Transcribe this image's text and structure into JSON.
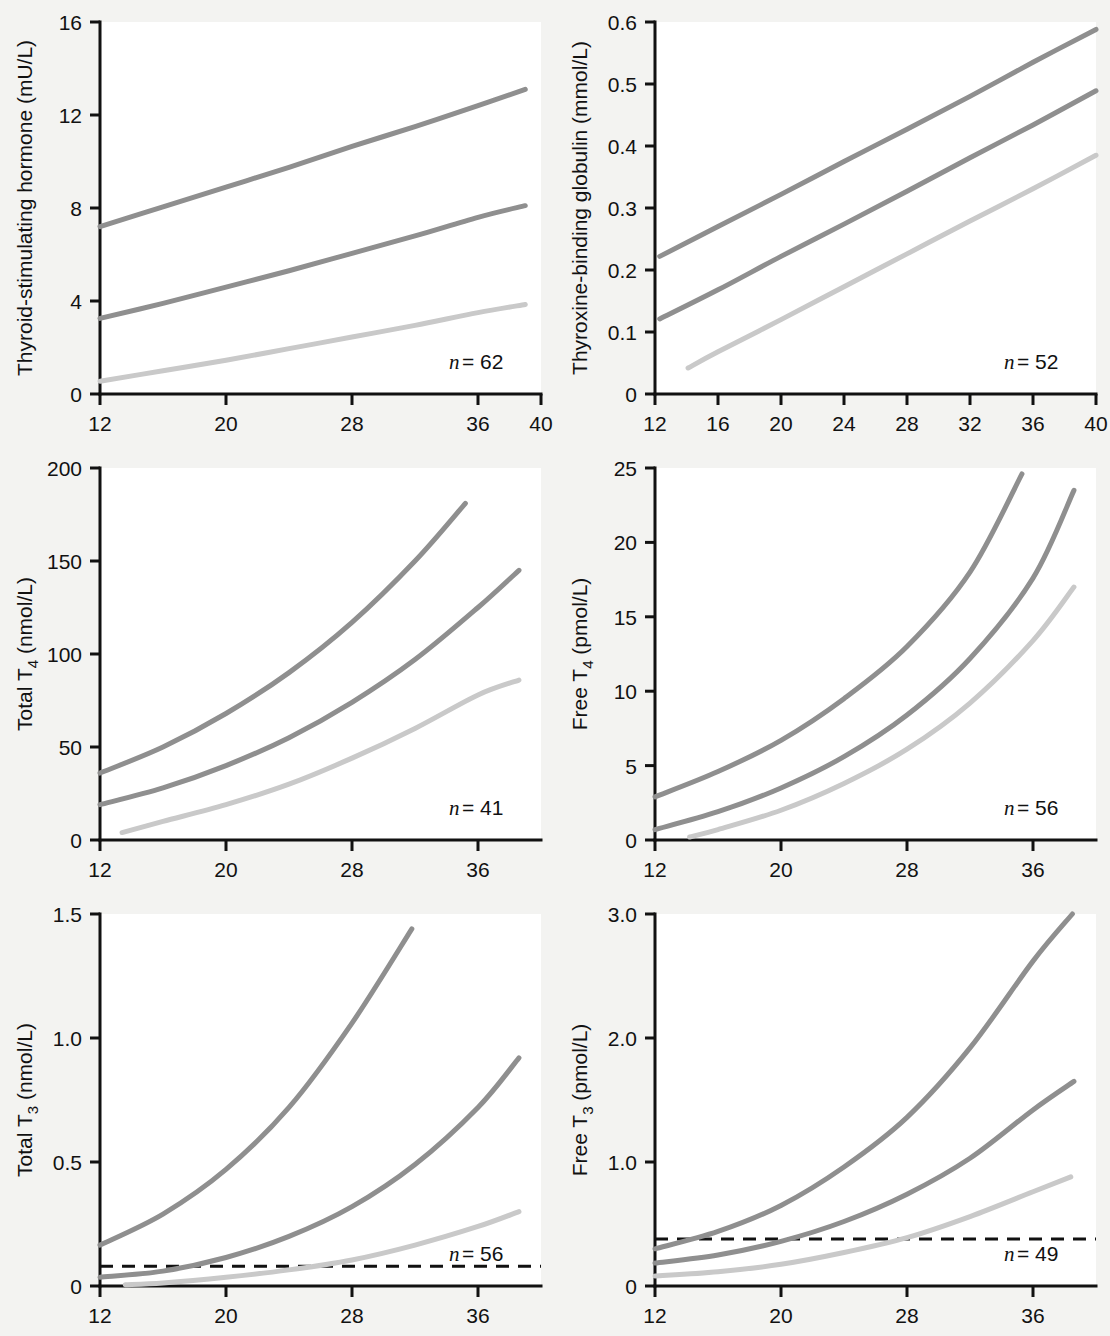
{
  "figure": {
    "background_color": "#f3f3f1",
    "axis_color": "#111111",
    "shared_xlabel": "Gestation (wk)",
    "curve_colors": {
      "upper": "#8f8f8f",
      "median": "#8f8f8f",
      "lower": "#c9c9c9"
    }
  },
  "chart_data": [
    {
      "id": "A",
      "type": "line",
      "panel_letter": "A",
      "title": "",
      "ylabel": "Thyroid-stimulating hormone (mU/L)",
      "ylabel_main": "Thyroid-stimulating hormone (mU/L)",
      "xlabel": "Gestation (wk)",
      "annotation_italic": "n",
      "annotation_text": " = 62",
      "annotation_full": "n = 62",
      "sample_size": 62,
      "xlim": [
        12,
        40
      ],
      "ylim": [
        0,
        16
      ],
      "xticks": [
        12,
        20,
        28,
        36,
        40
      ],
      "xtick_labels": [
        "12",
        "20",
        "28",
        "36",
        "40"
      ],
      "yticks": [
        0,
        4,
        8,
        12,
        16
      ],
      "ytick_labels": [
        "0",
        "4",
        "8",
        "12",
        "16"
      ],
      "grid": false,
      "legend": "none",
      "reference_line": null,
      "series": [
        {
          "name": "upper-centile",
          "color": "#8f8f8f",
          "x": [
            12,
            16,
            20,
            24,
            28,
            32,
            36,
            39
          ],
          "values": [
            7.2,
            8.05,
            8.9,
            9.75,
            10.65,
            11.5,
            12.4,
            13.1
          ]
        },
        {
          "name": "median",
          "color": "#8f8f8f",
          "x": [
            12,
            16,
            20,
            24,
            28,
            32,
            36,
            39
          ],
          "values": [
            3.25,
            3.9,
            4.6,
            5.3,
            6.05,
            6.8,
            7.6,
            8.1
          ]
        },
        {
          "name": "lower-centile",
          "color": "#c9c9c9",
          "x": [
            12,
            16,
            20,
            24,
            28,
            32,
            36,
            39
          ],
          "values": [
            0.55,
            1.0,
            1.45,
            1.95,
            2.45,
            2.95,
            3.5,
            3.85
          ]
        }
      ]
    },
    {
      "id": "B",
      "type": "line",
      "panel_letter": "B",
      "title": "",
      "ylabel": "Thyroxine-binding globulin (mmol/L)",
      "ylabel_main": "Thyroxine-binding globulin (mmol/L)",
      "xlabel": "Gestation (wk)",
      "annotation_italic": "n",
      "annotation_text": " = 52",
      "annotation_full": "n = 52",
      "sample_size": 52,
      "xlim": [
        12,
        40
      ],
      "ylim": [
        0,
        0.6
      ],
      "xticks": [
        12,
        16,
        20,
        24,
        28,
        32,
        36,
        40
      ],
      "xtick_labels": [
        "12",
        "16",
        "20",
        "24",
        "28",
        "32",
        "36",
        "40"
      ],
      "yticks": [
        0,
        0.1,
        0.2,
        0.3,
        0.4,
        0.5,
        0.6
      ],
      "ytick_labels": [
        "0",
        "0.1",
        "0.2",
        "0.3",
        "0.4",
        "0.5",
        "0.6"
      ],
      "grid": false,
      "legend": "none",
      "reference_line": null,
      "series": [
        {
          "name": "upper-centile",
          "color": "#8f8f8f",
          "x": [
            12.3,
            16,
            20,
            24,
            28,
            32,
            36,
            40
          ],
          "values": [
            0.222,
            0.27,
            0.322,
            0.375,
            0.427,
            0.48,
            0.535,
            0.588
          ]
        },
        {
          "name": "median",
          "color": "#8f8f8f",
          "x": [
            12.3,
            16,
            20,
            24,
            28,
            32,
            36,
            40
          ],
          "values": [
            0.121,
            0.168,
            0.222,
            0.274,
            0.327,
            0.381,
            0.434,
            0.489
          ]
        },
        {
          "name": "lower-centile",
          "color": "#c9c9c9",
          "x": [
            14.1,
            16,
            20,
            24,
            28,
            32,
            36,
            40
          ],
          "values": [
            0.042,
            0.068,
            0.12,
            0.173,
            0.226,
            0.279,
            0.331,
            0.385
          ]
        }
      ]
    },
    {
      "id": "C",
      "type": "line",
      "panel_letter": "C",
      "title": "",
      "ylabel": "Total T4 (nmol/L)",
      "ylabel_main": "Total T",
      "ylabel_sub": "4",
      "ylabel_tail": " (nmol/L)",
      "xlabel": "Gestation (wk)",
      "annotation_italic": "n",
      "annotation_text": " = 41",
      "annotation_full": "n = 41",
      "sample_size": 41,
      "xlim": [
        12,
        40
      ],
      "ylim": [
        0,
        200
      ],
      "xticks": [
        12,
        20,
        28,
        36
      ],
      "xtick_labels": [
        "12",
        "20",
        "28",
        "36"
      ],
      "yticks": [
        0,
        50,
        100,
        150,
        200
      ],
      "ytick_labels": [
        "0",
        "50",
        "100",
        "150",
        "200"
      ],
      "grid": false,
      "legend": "none",
      "reference_line": null,
      "series": [
        {
          "name": "upper-centile",
          "color": "#8f8f8f",
          "x": [
            12,
            16,
            20,
            24,
            28,
            32,
            35.2
          ],
          "values": [
            36,
            50,
            68,
            90,
            117,
            150,
            181
          ]
        },
        {
          "name": "median",
          "color": "#8f8f8f",
          "x": [
            12,
            16,
            20,
            24,
            28,
            32,
            36,
            38.6
          ],
          "values": [
            19,
            28,
            40,
            55,
            74,
            97,
            125,
            145
          ]
        },
        {
          "name": "lower-centile",
          "color": "#c9c9c9",
          "x": [
            13.4,
            16,
            20,
            24,
            28,
            32,
            36,
            38.6
          ],
          "values": [
            4,
            10,
            19,
            30,
            44,
            60,
            78,
            86
          ]
        }
      ]
    },
    {
      "id": "D",
      "type": "line",
      "panel_letter": "D",
      "title": "",
      "ylabel": "Free T4 (pmol/L)",
      "ylabel_main": "Free T",
      "ylabel_sub": "4",
      "ylabel_tail": " (pmol/L)",
      "xlabel": "Gestation (wk)",
      "annotation_italic": "n",
      "annotation_text": " = 56",
      "annotation_full": "n = 56",
      "sample_size": 56,
      "xlim": [
        12,
        40
      ],
      "ylim": [
        0,
        25
      ],
      "xticks": [
        12,
        20,
        28,
        36
      ],
      "xtick_labels": [
        "12",
        "20",
        "28",
        "36"
      ],
      "yticks": [
        0,
        5,
        10,
        15,
        20,
        25
      ],
      "ytick_labels": [
        "0",
        "5",
        "10",
        "15",
        "20",
        "25"
      ],
      "grid": false,
      "legend": "none",
      "reference_line": null,
      "series": [
        {
          "name": "upper-centile",
          "color": "#8f8f8f",
          "x": [
            12,
            16,
            20,
            24,
            28,
            32,
            35.3
          ],
          "values": [
            2.9,
            4.6,
            6.7,
            9.5,
            13.0,
            18.0,
            24.6
          ]
        },
        {
          "name": "median",
          "color": "#8f8f8f",
          "x": [
            12,
            16,
            20,
            24,
            28,
            32,
            36,
            38.6
          ],
          "values": [
            0.7,
            1.9,
            3.5,
            5.6,
            8.4,
            12.2,
            17.6,
            23.5
          ]
        },
        {
          "name": "lower-centile",
          "color": "#c9c9c9",
          "x": [
            14.2,
            16,
            20,
            24,
            28,
            32,
            36,
            38.6
          ],
          "values": [
            0.2,
            0.7,
            2.0,
            3.8,
            6.1,
            9.2,
            13.4,
            17.0
          ]
        }
      ]
    },
    {
      "id": "E",
      "type": "line",
      "panel_letter": "E",
      "title": "",
      "ylabel": "Total T3 (nmol/L)",
      "ylabel_main": "Total T",
      "ylabel_sub": "3",
      "ylabel_tail": " (nmol/L)",
      "xlabel": "Gestation (wk)",
      "annotation_italic": "n",
      "annotation_text": " = 56",
      "annotation_full": "n = 56",
      "sample_size": 56,
      "xlim": [
        12,
        40
      ],
      "ylim": [
        0,
        1.5
      ],
      "xticks": [
        12,
        20,
        28,
        36
      ],
      "xtick_labels": [
        "12",
        "20",
        "28",
        "36"
      ],
      "yticks": [
        0,
        0.5,
        1.0,
        1.5
      ],
      "ytick_labels": [
        "0",
        "0.5",
        "1.0",
        "1.5"
      ],
      "grid": false,
      "legend": "none",
      "reference_line": {
        "y": 0.08,
        "style": "dashed",
        "color": "#111111"
      },
      "series": [
        {
          "name": "upper-centile",
          "color": "#8f8f8f",
          "x": [
            12,
            16,
            20,
            24,
            28,
            31.8
          ],
          "values": [
            0.165,
            0.29,
            0.47,
            0.72,
            1.06,
            1.44
          ]
        },
        {
          "name": "median",
          "color": "#8f8f8f",
          "x": [
            12,
            16,
            20,
            24,
            28,
            32,
            36,
            38.6
          ],
          "values": [
            0.035,
            0.06,
            0.115,
            0.2,
            0.32,
            0.49,
            0.72,
            0.92
          ]
        },
        {
          "name": "lower-centile",
          "color": "#c9c9c9",
          "x": [
            13.6,
            16,
            20,
            24,
            28,
            32,
            36,
            38.6
          ],
          "values": [
            0.005,
            0.012,
            0.035,
            0.065,
            0.105,
            0.165,
            0.24,
            0.3
          ]
        }
      ]
    },
    {
      "id": "F",
      "type": "line",
      "panel_letter": "F",
      "title": "",
      "ylabel": "Free T3 (pmol/L)",
      "ylabel_main": "Free T",
      "ylabel_sub": "3",
      "ylabel_tail": " (pmol/L)",
      "xlabel": "Gestation (wk)",
      "annotation_italic": "n",
      "annotation_text": " = 49",
      "annotation_full": "n = 49",
      "sample_size": 49,
      "xlim": [
        12,
        40
      ],
      "ylim": [
        0,
        3.0
      ],
      "xticks": [
        12,
        20,
        28,
        36
      ],
      "xtick_labels": [
        "12",
        "20",
        "28",
        "36"
      ],
      "yticks": [
        0,
        1.0,
        2.0,
        3.0
      ],
      "ytick_labels": [
        "0",
        "1.0",
        "2.0",
        "3.0"
      ],
      "grid": false,
      "legend": "none",
      "reference_line": {
        "y": 0.38,
        "style": "dashed",
        "color": "#111111"
      },
      "series": [
        {
          "name": "upper-centile",
          "color": "#8f8f8f",
          "x": [
            12,
            16,
            20,
            24,
            28,
            32,
            36,
            38.5
          ],
          "values": [
            0.3,
            0.44,
            0.65,
            0.96,
            1.36,
            1.92,
            2.62,
            3.0
          ]
        },
        {
          "name": "median",
          "color": "#8f8f8f",
          "x": [
            12,
            16,
            20,
            24,
            28,
            32,
            36,
            38.6
          ],
          "values": [
            0.185,
            0.25,
            0.36,
            0.52,
            0.74,
            1.03,
            1.42,
            1.65
          ]
        },
        {
          "name": "lower-centile",
          "color": "#c9c9c9",
          "x": [
            12,
            16,
            20,
            24,
            28,
            32,
            36,
            38.4
          ],
          "values": [
            0.08,
            0.115,
            0.175,
            0.27,
            0.39,
            0.56,
            0.76,
            0.88
          ]
        }
      ]
    }
  ]
}
